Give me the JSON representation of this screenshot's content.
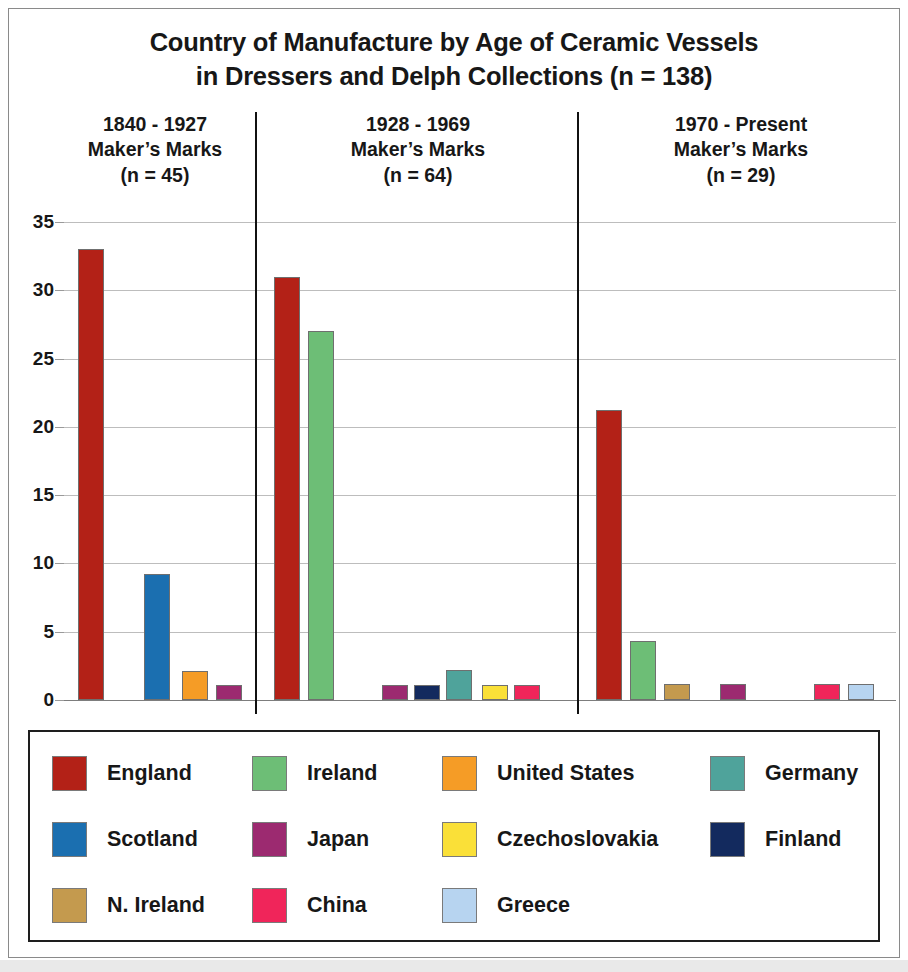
{
  "chart_data": {
    "type": "bar",
    "title": "Country of Manufacture by Age of Ceramic Vessels in Dressers and Delph Collections (n = 138)",
    "title_lines": [
      "Country of Manufacture by Age of Ceramic Vessels",
      "in Dressers and Delph Collections (n = 138)"
    ],
    "xlabel": "",
    "ylabel": "",
    "ylim": [
      0,
      35
    ],
    "y_ticks": [
      0,
      5,
      10,
      15,
      20,
      25,
      30,
      35
    ],
    "y_tick_labels": [
      "0",
      "5",
      "10",
      "15",
      "20",
      "25",
      "30",
      "35"
    ],
    "grid": true,
    "legend_position": "bottom",
    "total_n": 138,
    "panels": [
      {
        "id": "panel-1840-1927",
        "header_lines": [
          "1840 - 1927",
          "Maker’s Marks",
          "(n = 45)"
        ],
        "period": "1840 - 1927",
        "n": 45,
        "categories": [
          "England",
          "Scotland",
          "United States",
          "Japan"
        ],
        "values": [
          33,
          9.2,
          2.1,
          1.1
        ]
      },
      {
        "id": "panel-1928-1969",
        "header_lines": [
          "1928 - 1969",
          "Maker’s Marks",
          "(n = 64)"
        ],
        "period": "1928 - 1969",
        "n": 64,
        "categories": [
          "England",
          "Ireland",
          "Japan",
          "Finland",
          "Germany",
          "Czechoslovakia",
          "China"
        ],
        "values": [
          31,
          27,
          1.1,
          1.1,
          2.2,
          1.1,
          1.1
        ]
      },
      {
        "id": "panel-1970-present",
        "header_lines": [
          "1970 - Present",
          "Maker’s Marks",
          "(n = 29)"
        ],
        "period": "1970 - Present",
        "n": 29,
        "categories": [
          "England",
          "Ireland",
          "N. Ireland",
          "Japan",
          "China",
          "Greece"
        ],
        "values": [
          21.2,
          4.3,
          1.2,
          1.2,
          1.2,
          1.2
        ]
      }
    ],
    "legend": [
      {
        "label": "England",
        "color": "#B32117"
      },
      {
        "label": "Ireland",
        "color": "#6DBE76"
      },
      {
        "label": "United States",
        "color": "#F59C26"
      },
      {
        "label": "Germany",
        "color": "#4FA39B"
      },
      {
        "label": "Scotland",
        "color": "#1B6FB0"
      },
      {
        "label": "Japan",
        "color": "#9C2A70"
      },
      {
        "label": "Czechoslovakia",
        "color": "#FAE038"
      },
      {
        "label": "Finland",
        "color": "#132A5E"
      },
      {
        "label": "N. Ireland",
        "color": "#C49A4E"
      },
      {
        "label": "China",
        "color": "#F0255A"
      },
      {
        "label": "Greece",
        "color": "#B7D4F0"
      }
    ]
  }
}
